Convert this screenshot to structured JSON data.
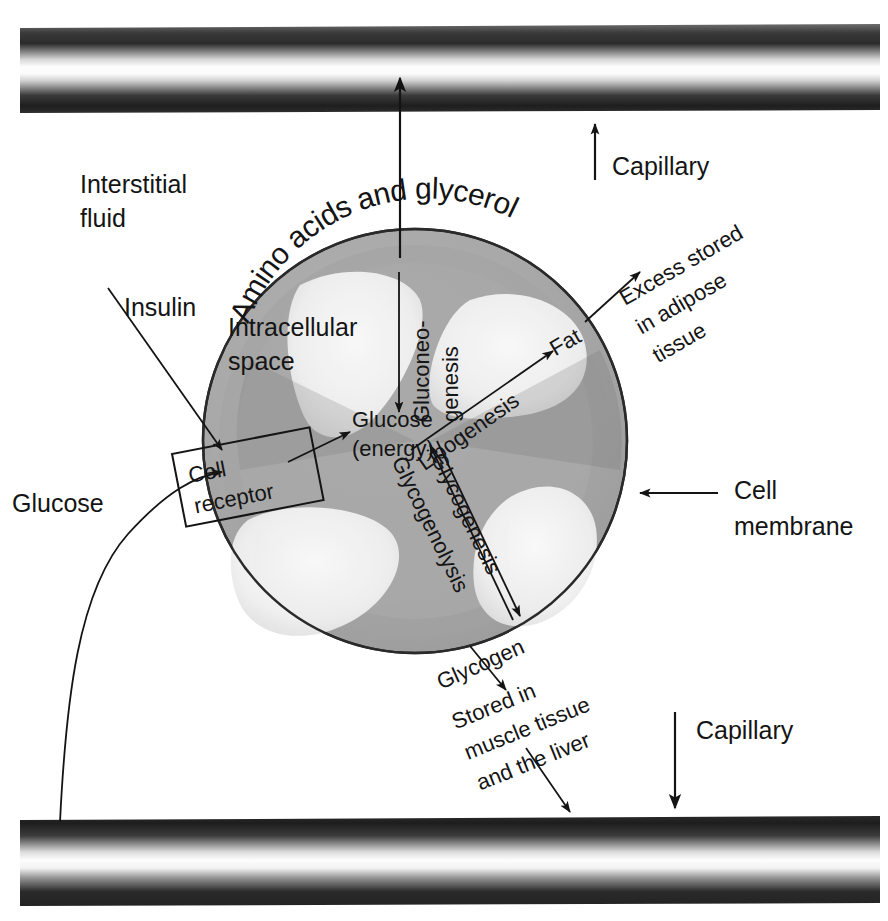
{
  "diagram": {
    "background_color": "#ffffff",
    "ink_color": "#141414",
    "cell_fill_color": "#a9a9a9",
    "cell_inner_shade_color": "#9a9a9a",
    "organelle_color": "#f2f2f2",
    "capillary_dark_color": "#1c1c1c",
    "capillary_light_color": "#fdfdfd"
  },
  "capillaries": {
    "top_label": "Capillary",
    "bottom_label": "Capillary"
  },
  "environment": {
    "interstitial_fluid_line1": "Interstitial",
    "interstitial_fluid_line2": "fluid"
  },
  "cell": {
    "membrane_label_line1": "Cell",
    "membrane_label_line2": "membrane",
    "intracellular_line1": "Intracellular",
    "intracellular_line2": "space",
    "receptor_line1": "Cell",
    "receptor_line2": "receptor",
    "glucose_center_line1": "Glucose",
    "glucose_center_line2": "(energy)"
  },
  "inputs": {
    "insulin": "Insulin",
    "glucose": "Glucose",
    "amino_acids_glycerol": "Amino acids and glycerol"
  },
  "pathways": [
    {
      "name": "gluconeogenesis",
      "line1": "Gluconeo-",
      "line2": "genesis",
      "direction": "down"
    },
    {
      "name": "lipogenesis",
      "label": "Lipogenesis",
      "direction": "up-right"
    },
    {
      "name": "glycogenesis",
      "label": "Glycogenesis",
      "direction": "down-right"
    },
    {
      "name": "glycogenolysis",
      "label": "Glycogenolysis",
      "direction": "up-left"
    }
  ],
  "products": {
    "fat": "Fat",
    "glycogen": "Glycogen"
  },
  "fates": {
    "fat_line1": "Excess stored",
    "fat_line2": "in adipose",
    "fat_line3": "tissue",
    "glycogen_line1": "Stored in",
    "glycogen_line2": "muscle tissue",
    "glycogen_line3": "and the liver"
  }
}
